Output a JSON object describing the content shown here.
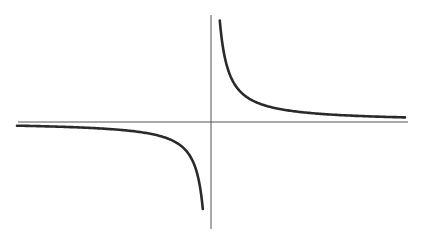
{
  "chart_data": {
    "type": "line",
    "title": "",
    "xlabel": "",
    "ylabel": "",
    "function": "y = 1/x",
    "grid": false,
    "legend": null,
    "xlim": [
      -10,
      10
    ],
    "ylim": [
      -5.5,
      5.5
    ],
    "series": [
      {
        "name": "left-branch",
        "x": [
          -10,
          -8,
          -6,
          -4,
          -3,
          -2,
          -1.5,
          -1,
          -0.75,
          -0.5,
          -0.4,
          -0.3,
          -0.25,
          -0.2
        ],
        "y": [
          -0.1,
          -0.125,
          -0.167,
          -0.25,
          -0.333,
          -0.5,
          -0.667,
          -1,
          -1.333,
          -2,
          -2.5,
          -3.333,
          -4,
          -5
        ]
      },
      {
        "name": "right-branch",
        "x": [
          0.2,
          0.25,
          0.3,
          0.4,
          0.5,
          0.75,
          1,
          1.5,
          2,
          3,
          4,
          6,
          8,
          10
        ],
        "y": [
          5,
          4,
          3.333,
          2.5,
          2,
          1.333,
          1,
          0.667,
          0.5,
          0.333,
          0.25,
          0.167,
          0.125,
          0.1
        ]
      }
    ]
  },
  "colors": {
    "curve": "#2a2a2a",
    "axis": "#555555",
    "background": "#ffffff"
  },
  "layout": {
    "origin_px": [
      211,
      122
    ],
    "x_axis_px": [
      18,
      408
    ],
    "y_axis_px": [
      15,
      229
    ],
    "left_curve_start_px": [
      17,
      126
    ],
    "right_curve_end_px": [
      405,
      117
    ]
  }
}
